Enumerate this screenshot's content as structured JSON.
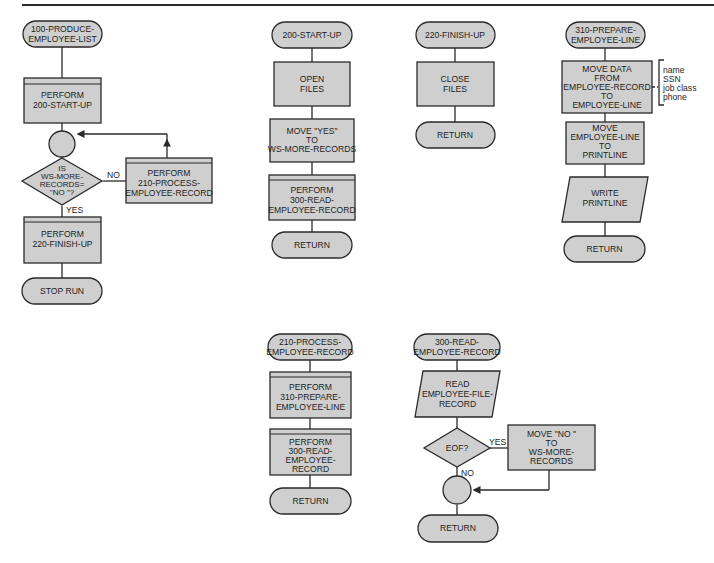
{
  "diagram": {
    "type": "structured-flowchart",
    "accent_colors": {
      "shape_fill": "#cfcfcf",
      "stroke": "#2a2a2a",
      "background": "#ffffff"
    },
    "modules": {
      "m100": {
        "terminal": [
          "100-PRODUCE-",
          "EMPLOYEE-LIST"
        ],
        "perform_startup": [
          "PERFORM",
          "200-START-UP"
        ],
        "decision": [
          "IS",
          "WS-MORE-",
          "RECORDS=",
          "\"NO \"?"
        ],
        "no_label": "NO",
        "yes_label": "YES",
        "perform_process": [
          "PERFORM",
          "210-PROCESS-",
          "EMPLOYEE-RECORD"
        ],
        "perform_finish": [
          "PERFORM",
          "220-FINISH-UP"
        ],
        "end": "STOP RUN"
      },
      "m200": {
        "terminal": "200-START-UP",
        "open": [
          "OPEN",
          "FILES"
        ],
        "move": [
          "MOVE \"YES\"",
          "TO",
          "WS-MORE-RECORDS"
        ],
        "perform_read": [
          "PERFORM",
          "300-READ-",
          "EMPLOYEE-RECORD"
        ],
        "end": "RETURN"
      },
      "m220": {
        "terminal": "220-FINISH-UP",
        "close": [
          "CLOSE",
          "FILES"
        ],
        "end": "RETURN"
      },
      "m310": {
        "terminal": [
          "310-PREPARE-",
          "EMPLOYEE-LINE"
        ],
        "move_data": [
          "MOVE DATA",
          "FROM",
          "EMPLOYEE-RECORD",
          "TO",
          "EMPLOYEE-LINE"
        ],
        "fields": [
          "name",
          "SSN",
          "job class",
          "phone"
        ],
        "move_line": [
          "MOVE",
          "EMPLOYEE-LINE",
          "TO",
          "PRINTLINE"
        ],
        "write": [
          "WRITE",
          "PRINTLINE"
        ],
        "end": "RETURN"
      },
      "m210": {
        "terminal": [
          "210-PROCESS-",
          "EMPLOYEE-RECORD"
        ],
        "perform_prepare": [
          "PERFORM",
          "310-PREPARE-",
          "EMPLOYEE-LINE"
        ],
        "perform_read": [
          "PERFORM",
          "300-READ-",
          "EMPLOYEE-",
          "RECORD"
        ],
        "end": "RETURN"
      },
      "m300": {
        "terminal": [
          "300-READ-",
          "EMPLOYEE-RECORD"
        ],
        "read": [
          "READ",
          "EMPLOYEE-FILE-",
          "RECORD"
        ],
        "decision": "EOF?",
        "yes_label": "YES",
        "no_label": "NO",
        "move": [
          "MOVE \"NO \"",
          "TO",
          "WS-MORE-",
          "RECORDS"
        ],
        "end": "RETURN"
      }
    }
  }
}
